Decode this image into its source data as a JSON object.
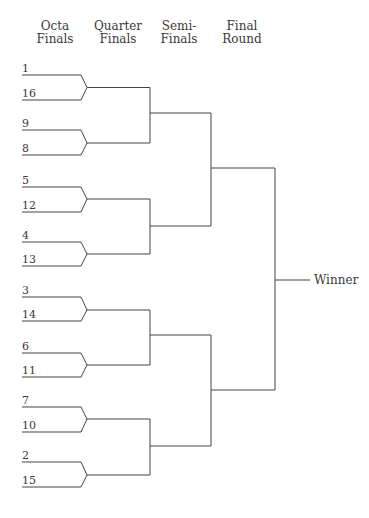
{
  "headers": [
    {
      "line1": "Octa",
      "line2": "Finals"
    },
    {
      "line1": "Quarter",
      "line2": "Finals"
    },
    {
      "line1": "Semi-",
      "line2": "Finals"
    },
    {
      "line1": "Final",
      "line2": "Round"
    }
  ],
  "seeds": [
    "1",
    "16",
    "9",
    "8",
    "5",
    "12",
    "4",
    "13",
    "3",
    "14",
    "6",
    "11",
    "7",
    "10",
    "2",
    "15"
  ],
  "winner_label": "Winner",
  "line_color": "#444444"
}
